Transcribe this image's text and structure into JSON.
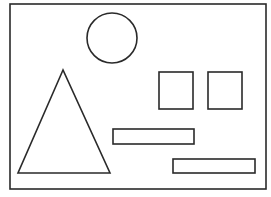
{
  "canvas": {
    "width": 271,
    "height": 197,
    "background": "#ffffff"
  },
  "style": {
    "stroke": "#2a2a2a",
    "stroke_width": 1.6,
    "fill": "none"
  },
  "shapes": {
    "frame": {
      "type": "rect",
      "x": 10,
      "y": 4,
      "width": 256,
      "height": 185
    },
    "circle": {
      "type": "circle",
      "cx": 112,
      "cy": 38,
      "r": 25
    },
    "triangle": {
      "type": "polygon",
      "points": "63,70 18,173 110,173"
    },
    "square_left": {
      "type": "rect",
      "x": 159,
      "y": 72,
      "width": 34,
      "height": 37
    },
    "square_right": {
      "type": "rect",
      "x": 208,
      "y": 72,
      "width": 34,
      "height": 37
    },
    "bar_upper": {
      "type": "rect",
      "x": 113,
      "y": 129,
      "width": 81,
      "height": 15
    },
    "bar_lower": {
      "type": "rect",
      "x": 173,
      "y": 159,
      "width": 82,
      "height": 14
    }
  }
}
